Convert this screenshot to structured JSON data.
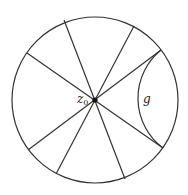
{
  "figure": {
    "width": 188,
    "height": 195,
    "stroke_color": "#333333",
    "disk": {
      "cx": 95,
      "cy": 100,
      "r": 83
    },
    "center_point": {
      "x": 95,
      "y": 100,
      "label": "z",
      "subscript": "0",
      "label_x": 77,
      "label_y": 103
    },
    "diameters": [
      {
        "x1": 64,
        "y1": 20,
        "x2": 125,
        "y2": 179
      },
      {
        "x1": 27,
        "y1": 53,
        "x2": 163,
        "y2": 148
      },
      {
        "x1": 134,
        "y1": 26,
        "x2": 56,
        "y2": 174
      },
      {
        "x1": 161,
        "y1": 50,
        "x2": 28,
        "y2": 150
      }
    ],
    "geodesic": {
      "label": "g",
      "label_x": 143,
      "label_y": 103,
      "x1": 161,
      "y1": 50,
      "x2": 163,
      "y2": 148,
      "arc_r": 62
    }
  }
}
